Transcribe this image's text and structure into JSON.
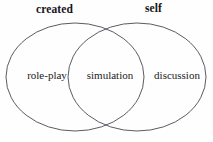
{
  "figure": {
    "type": "venn-diagram-2-set",
    "background_color": "#fefefe",
    "stroke_color": "#4a4750",
    "text_color": "#16141a",
    "width": 213,
    "height": 142
  },
  "headers": {
    "left": "created",
    "right": "self"
  },
  "regions": {
    "left_only": "role-play",
    "intersection": "simulation",
    "right_only": "discussion"
  },
  "geometry": {
    "left_ellipse": {
      "cx": 75,
      "cy": 77,
      "rx": 69,
      "ry": 54
    },
    "right_ellipse": {
      "cx": 137,
      "cy": 77,
      "rx": 69,
      "ry": 54
    },
    "stroke_width": 0.9
  }
}
